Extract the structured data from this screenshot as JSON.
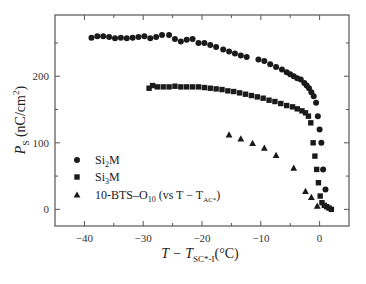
{
  "chart_data": {
    "type": "scatter",
    "title": "",
    "xlabel": "T − T_SC*-I (°C)",
    "ylabel": "P_S (nC/cm²)",
    "xlim": [
      -45,
      5
    ],
    "ylim": [
      -25,
      292
    ],
    "xticks": [
      -40,
      -30,
      -20,
      -10,
      0
    ],
    "xticks_minor": [
      -35,
      -25,
      -15,
      -5
    ],
    "yticks": [
      0,
      100,
      200
    ],
    "yticks_minor": [
      50,
      150,
      250
    ],
    "grid": false,
    "legend_position": "lower-left inside",
    "series": [
      {
        "name": "Si2M",
        "marker": "circle",
        "x": [
          -38.8,
          -37.8,
          -36.8,
          -35.8,
          -34.8,
          -33.8,
          -32.8,
          -31.8,
          -30.8,
          -29.8,
          -28.8,
          -27.8,
          -26.8,
          -25.6,
          -24.6,
          -23.6,
          -22.6,
          -21.6,
          -20.6,
          -19.6,
          -18.6,
          -17.6,
          -16.4,
          -15.4,
          -14.4,
          -13.4,
          -12.4,
          -10.4,
          -9.4,
          -8.4,
          -7.4,
          -6.4,
          -5.6,
          -5.0,
          -4.4,
          -3.8,
          -3.2,
          -2.6,
          -2.2,
          -1.8,
          -1.4,
          -1.0,
          -0.6,
          -0.3,
          0.0,
          0.3,
          0.6,
          1.0
        ],
        "y": [
          258,
          260,
          260,
          259,
          257,
          258,
          257,
          258,
          259,
          260,
          257,
          259,
          262,
          262,
          256,
          252,
          255,
          256,
          250,
          250,
          247,
          244,
          240,
          237,
          234,
          231,
          229,
          225,
          223,
          218,
          214,
          210,
          206,
          203,
          200,
          197,
          195,
          190,
          186,
          182,
          176,
          170,
          160,
          140,
          120,
          100,
          60,
          30
        ]
      },
      {
        "name": "Si3M",
        "marker": "square",
        "x": [
          -29.0,
          -28.4,
          -27.6,
          -26.6,
          -25.6,
          -24.6,
          -23.6,
          -22.6,
          -21.6,
          -20.6,
          -19.6,
          -18.6,
          -17.6,
          -16.6,
          -15.6,
          -14.6,
          -13.6,
          -12.6,
          -11.6,
          -10.6,
          -9.6,
          -8.6,
          -7.6,
          -6.6,
          -5.6,
          -4.6,
          -3.8,
          -3.0,
          -2.4,
          -1.9,
          -1.5,
          -1.1,
          -0.8,
          -0.5,
          -0.2,
          0.1,
          0.4,
          0.8,
          1.2,
          1.6,
          2.0
        ],
        "y": [
          182,
          186,
          184,
          184,
          184,
          185,
          184,
          184,
          184,
          184,
          183,
          182,
          181,
          180,
          178,
          177,
          175,
          173,
          171,
          169,
          167,
          164,
          162,
          159,
          156,
          154,
          151,
          148,
          145,
          140,
          130,
          100,
          80,
          60,
          40,
          20,
          10,
          6,
          4,
          2,
          0
        ]
      },
      {
        "name": "10-BTS-O10 (vs T − T_AC*)",
        "marker": "triangle",
        "x": [
          -15.4,
          -13.4,
          -11.4,
          -9.4,
          -7.4,
          -4.4,
          -2.4,
          -1.4,
          -0.4
        ],
        "y": [
          112,
          106,
          99,
          92,
          81,
          62,
          27,
          18,
          5
        ]
      }
    ]
  },
  "legend": {
    "items": [
      {
        "marker": "circle",
        "base": "Si",
        "sub": "2",
        "rest": "M"
      },
      {
        "marker": "square",
        "base": "Si",
        "sub": "3",
        "rest": "M"
      },
      {
        "marker": "triangle",
        "base": "10-BTS–O",
        "sub": "10",
        "rest": " (vs T − T",
        "sub2": "AC*",
        "tail": ")"
      }
    ]
  },
  "axes": {
    "x_title_main": "T − T",
    "x_title_sub": "SC*-I",
    "x_title_unit": "(°C)",
    "y_title_main": "P",
    "y_title_sub": "S",
    "y_title_unit": "(nC/cm",
    "y_title_sup": "2",
    "y_title_close": ")"
  },
  "colors": {
    "ink": "#1a1a1a",
    "frame": "#555555",
    "background": "#ffffff"
  }
}
